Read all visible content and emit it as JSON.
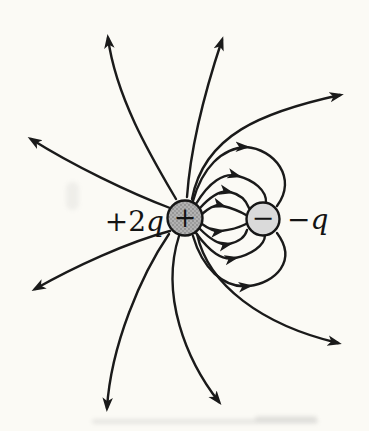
{
  "figure": {
    "background": "#fbfaf5",
    "line_color": "#1a1a1a",
    "charges": [
      {
        "name": "positive charge",
        "label_plain": "+2",
        "label_italic": "q",
        "symbol": "+",
        "fill": "#b2b2b2"
      },
      {
        "name": "negative charge",
        "label_plain": "−",
        "label_italic": "q",
        "symbol": "−",
        "fill": "#dadada"
      }
    ]
  }
}
